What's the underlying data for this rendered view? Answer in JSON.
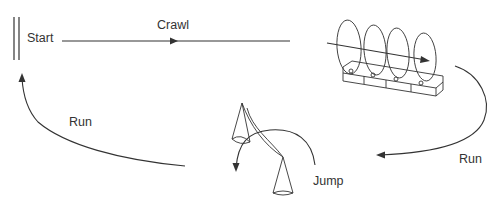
{
  "diagram": {
    "type": "locomotion-cycle",
    "labels": {
      "start": "Start",
      "crawl": "Crawl",
      "run_right": "Run",
      "jump": "Jump",
      "run_left": "Run"
    },
    "stages": [
      {
        "id": "start",
        "label": "Start"
      },
      {
        "id": "crawl",
        "label": "Crawl"
      },
      {
        "id": "run_right",
        "label": "Run"
      },
      {
        "id": "jump",
        "label": "Jump"
      },
      {
        "id": "run_left",
        "label": "Run"
      }
    ],
    "colors": {
      "line": "#333333",
      "background": "#ffffff"
    }
  }
}
